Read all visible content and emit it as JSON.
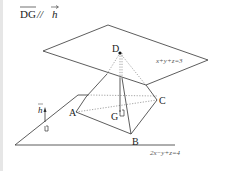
{
  "title": {
    "text": "DG//h",
    "vector_left": "DG",
    "vector_right": "h",
    "separator": "//"
  },
  "planes": {
    "upper": {
      "equation": "x+y+z=3"
    },
    "lower": {
      "equation": "2x−y+z=4"
    }
  },
  "points": {
    "A": "A",
    "B": "B",
    "C": "C",
    "D": "D",
    "G": "G"
  },
  "vector": {
    "label": "h"
  },
  "colors": {
    "line": "#333333",
    "dotted": "#666666",
    "background": "#ffffff"
  }
}
